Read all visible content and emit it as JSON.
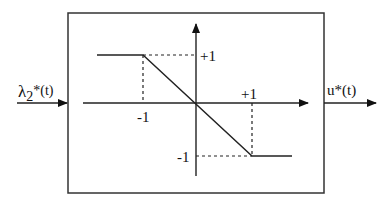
{
  "diagram": {
    "input_label": "λ",
    "input_subscript": "2",
    "input_suffix": "*(t)",
    "output_label": "u*(t)",
    "tick_labels": {
      "y_pos": "+1",
      "y_neg": "-1",
      "x_pos": "+1",
      "x_neg": "-1"
    },
    "function": "saturation with negative slope: u = -λ clipped to [-1, +1]"
  },
  "colors": {
    "stroke": "#222222",
    "background": "#ffffff"
  }
}
